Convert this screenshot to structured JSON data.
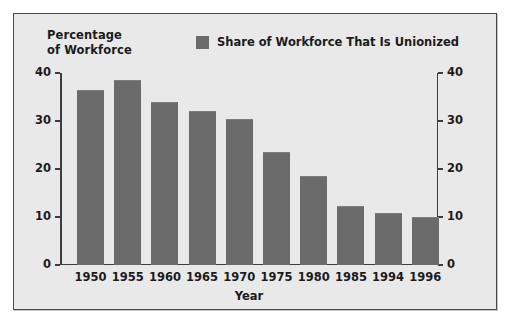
{
  "figure": {
    "background_color": "#e9e9e9",
    "border_color": "#4a4a4a",
    "bar_color": "#6b6b6b",
    "text_color": "#1b1b1b"
  },
  "legend": {
    "swatch_name": "legend-color-swatch",
    "label": "Share of Workforce That Is Unionized"
  },
  "chart_data": {
    "type": "bar",
    "title": "",
    "ylabel": "Percentage\nof Workforce",
    "xlabel": "Year",
    "categories": [
      "1950",
      "1955",
      "1960",
      "1965",
      "1970",
      "1975",
      "1980",
      "1985",
      "1994",
      "1996"
    ],
    "values": [
      36.5,
      38.5,
      34,
      32,
      30.5,
      23.5,
      18.5,
      12.2,
      10.8,
      10
    ],
    "series": [
      {
        "name": "Share of Workforce That Is Unionized",
        "color": "#6b6b6b",
        "values": [
          36.5,
          38.5,
          34,
          32,
          30.5,
          23.5,
          18.5,
          12.2,
          10.8,
          10
        ]
      }
    ],
    "ylim": [
      0,
      40
    ],
    "yticks": [
      0,
      10,
      20,
      30,
      40
    ],
    "ytick_labels": [
      "0",
      "10",
      "20",
      "30",
      "40"
    ],
    "right_axis": {
      "ylim": [
        0,
        40
      ],
      "yticks": [
        0,
        10,
        20,
        30,
        40
      ],
      "ytick_labels": [
        "0",
        "10",
        "20",
        "30",
        "40"
      ]
    },
    "grid": false,
    "legend_position": "upper center"
  }
}
